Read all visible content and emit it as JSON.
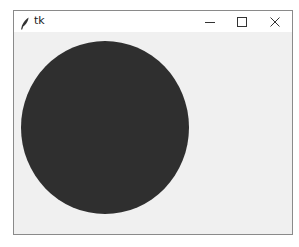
{
  "window": {
    "title": "tk",
    "app_icon": "tk-feather-icon",
    "controls": {
      "minimize": "minimize-icon",
      "maximize": "maximize-icon",
      "close": "close-icon"
    }
  },
  "canvas": {
    "background": "#f0f0f0",
    "shapes": [
      {
        "type": "oval",
        "fill": "#2f2f2f"
      }
    ]
  }
}
